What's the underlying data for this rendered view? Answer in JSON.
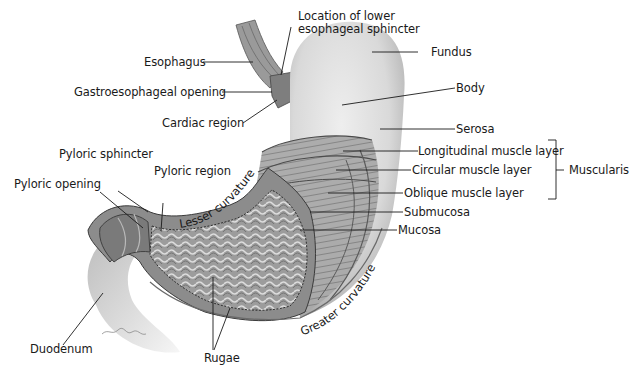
{
  "diagram": {
    "labels": {
      "location_les_line1": "Location of lower",
      "location_les_line2": "esophageal sphincter",
      "esophagus": "Esophagus",
      "fundus": "Fundus",
      "gastroesophageal_opening": "Gastroesophageal opening",
      "body": "Body",
      "cardiac_region": "Cardiac region",
      "serosa": "Serosa",
      "pyloric_sphincter": "Pyloric sphincter",
      "pyloric_region": "Pyloric region",
      "pyloric_opening": "Pyloric opening",
      "longitudinal_muscle_layer": "Longitudinal muscle layer",
      "circular_muscle_layer": "Circular muscle layer",
      "oblique_muscle_layer": "Oblique muscle layer",
      "muscularis": "Muscularis",
      "submucosa": "Submucosa",
      "mucosa": "Mucosa",
      "lesser_curvature": "Lesser curvature",
      "greater_curvature": "Greater curvature",
      "duodenum": "Duodenum",
      "rugae": "Rugae"
    },
    "colors": {
      "serosa": "#d4d4d4",
      "muscle": "#8a8a8a",
      "mucosa": "#6e6e6e",
      "line": "#1a1a1a"
    }
  }
}
